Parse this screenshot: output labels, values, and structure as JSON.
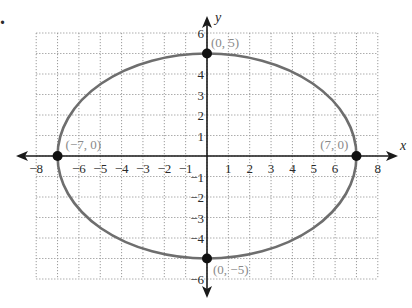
{
  "problem_marker": ".",
  "chart_data": {
    "type": "line",
    "title": "",
    "xlabel": "x",
    "ylabel": "y",
    "xlim": [
      -8,
      8
    ],
    "ylim": [
      -6,
      6
    ],
    "grid": true,
    "grid_style": "dotted",
    "x_ticks": [
      -8,
      -6,
      -5,
      -4,
      -3,
      -2,
      -1,
      1,
      2,
      3,
      4,
      5,
      6,
      8
    ],
    "x_tick_labels": [
      "−8",
      "−6",
      "−5",
      "−4",
      "−3",
      "−2",
      "−1",
      "1",
      "2",
      "3",
      "4",
      "5",
      "6",
      "8"
    ],
    "y_ticks": [
      6,
      4,
      3,
      2,
      1,
      -1,
      -2,
      -3,
      -4,
      -6
    ],
    "y_tick_labels": [
      "6",
      "4",
      "3",
      "2",
      "1",
      "−1",
      "−2",
      "−3",
      "−4",
      "−6"
    ],
    "series": [
      {
        "name": "ellipse",
        "shape": "ellipse",
        "center": [
          0,
          0
        ],
        "semi_major_x": 7,
        "semi_minor_y": 5,
        "color": "#6e6e6e"
      }
    ],
    "points": [
      {
        "x": 0,
        "y": 5,
        "label": "(0, 5)"
      },
      {
        "x": 7,
        "y": 0,
        "label": "(7, 0)"
      },
      {
        "x": -7,
        "y": 0,
        "label": "(−7, 0)"
      },
      {
        "x": 0,
        "y": -5,
        "label": "(0, −5)"
      }
    ],
    "legend": null
  }
}
